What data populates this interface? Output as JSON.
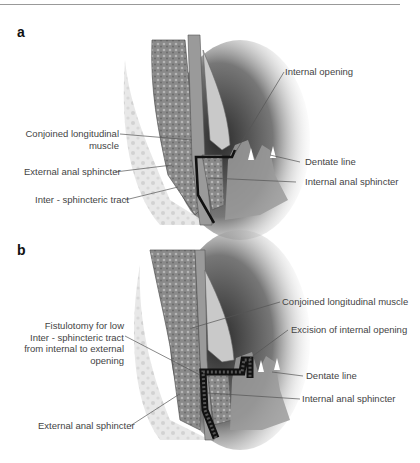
{
  "figure": {
    "panels": [
      {
        "letter": "a",
        "labels": {
          "internal_opening": "Internal opening",
          "conjoined_line1": "Conjoined longitudinal",
          "conjoined_line2": "muscle",
          "dentate_line": "Dentate line",
          "external_anal_sphincter": "External anal sphincter",
          "internal_anal_sphincter": "Internal anal sphincter",
          "inter_sphincteric_tract": "Inter - sphincteric tract"
        }
      },
      {
        "letter": "b",
        "labels": {
          "conjoined_longitudinal_muscle": "Conjoined longitudinal muscle",
          "fistulotomy_line1": "Fistulotomy for low",
          "fistulotomy_line2": "Inter - sphincteric tract",
          "fistulotomy_line3": "from internal to external",
          "fistulotomy_line4": "opening",
          "excision_internal_opening": "Excision of internal opening",
          "dentate_line": "Dentate line",
          "internal_anal_sphincter": "Internal anal sphincter",
          "external_anal_sphincter": "External anal sphincter"
        }
      }
    ]
  }
}
